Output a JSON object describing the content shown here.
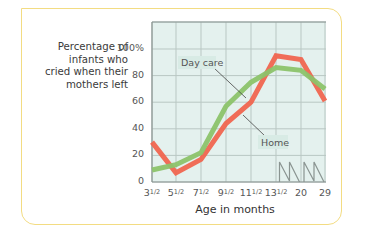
{
  "chart_data": {
    "type": "line",
    "title": "",
    "ylabel": "Percentage of infants who cried when their mothers left",
    "xlabel": "Age in months",
    "categories": [
      "3½",
      "5½",
      "7½",
      "9½",
      "11½",
      "13½",
      "20",
      "29"
    ],
    "x_tick_labels": [
      "3",
      "5",
      "7",
      "9",
      "11",
      "13",
      "20",
      "29"
    ],
    "y_ticks": [
      "100%",
      "80",
      "60",
      "40",
      "20",
      "0"
    ],
    "ylim": [
      0,
      100
    ],
    "grid": true,
    "axis_breaks_after": [
      "13½",
      "20"
    ],
    "series": [
      {
        "name": "Day care",
        "color": "#8cc36a",
        "values": [
          9,
          13,
          22,
          57,
          75,
          86,
          84,
          70
        ]
      },
      {
        "name": "Home",
        "color": "#f0654f",
        "values": [
          30,
          7,
          17,
          44,
          60,
          95,
          92,
          61
        ]
      }
    ],
    "annotations": [
      {
        "text": "Day care",
        "series": "Day care"
      },
      {
        "text": "Home",
        "series": "Home"
      }
    ]
  },
  "labels": {
    "ylabel_lines": [
      "Percentage of",
      "infants who",
      "cried when their",
      "mothers left"
    ],
    "xlabel": "Age in months",
    "day_care": "Day care",
    "home": "Home",
    "yticks": [
      "100%",
      "80",
      "60",
      "40",
      "20",
      "0"
    ]
  }
}
